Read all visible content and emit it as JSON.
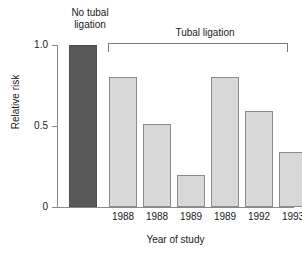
{
  "chart_data": {
    "type": "bar",
    "title": "",
    "subtitle": "",
    "xlabel": "Year of study",
    "ylabel": "Relative risk",
    "ylim": [
      0,
      1.0
    ],
    "yticks": [
      "0",
      "0.5",
      "1.0"
    ],
    "ytick_values": [
      0,
      0.5,
      1.0
    ],
    "grid": false,
    "legend": "none",
    "categories": [
      "",
      "1988",
      "1988",
      "1989",
      "1989",
      "1992",
      "1993"
    ],
    "values": [
      1.0,
      0.8,
      0.51,
      0.2,
      0.8,
      0.59,
      0.34
    ],
    "bars": [
      {
        "label": "",
        "year": "",
        "value": 1.0,
        "group": "No tubal ligation",
        "color": "#595959"
      },
      {
        "label": "1988",
        "year": "1988",
        "value": 0.8,
        "group": "Tubal ligation",
        "color": "#d8d8d8"
      },
      {
        "label": "1988",
        "year": "1988",
        "value": 0.51,
        "group": "Tubal ligation",
        "color": "#d8d8d8"
      },
      {
        "label": "1989",
        "year": "1989",
        "value": 0.2,
        "group": "Tubal ligation",
        "color": "#d8d8d8"
      },
      {
        "label": "1989",
        "year": "1989",
        "value": 0.8,
        "group": "Tubal ligation",
        "color": "#d8d8d8"
      },
      {
        "label": "1992",
        "year": "1992",
        "value": 0.59,
        "group": "Tubal ligation",
        "color": "#d8d8d8"
      },
      {
        "label": "1993",
        "year": "1993",
        "value": 0.34,
        "group": "Tubal ligation",
        "color": "#d8d8d8"
      }
    ],
    "annotations": [
      {
        "name": "no-tubal-ligation",
        "text": "No tubal\nligation"
      },
      {
        "name": "tubal-ligation-bracket",
        "text": "Tubal ligation"
      }
    ],
    "colors": {
      "reference_bar": "#595959",
      "study_bar_fill": "#d8d8d8",
      "study_bar_edge": "#8c8c8c",
      "axis": "#8a8a8a",
      "text": "#1a1a1a",
      "background": "#ffffff"
    }
  },
  "groups": {
    "no_ligation_label": "No tubal\nligation",
    "ligation_label": "Tubal ligation"
  },
  "axes": {
    "y_title": "Relative risk",
    "x_title": "Year of study",
    "y_ticks": [
      "1.0",
      "0.5",
      "0"
    ]
  }
}
